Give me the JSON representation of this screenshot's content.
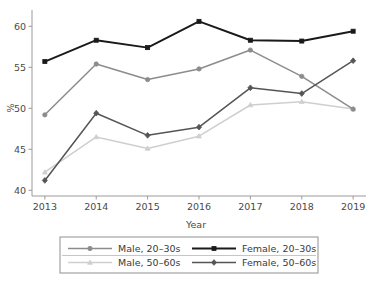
{
  "chart_data": {
    "type": "line",
    "title": "",
    "xlabel": "Year",
    "ylabel": "%",
    "categories": [
      "2013",
      "2014",
      "2015",
      "2016",
      "2017",
      "2018",
      "2019"
    ],
    "x": [
      2013,
      2014,
      2015,
      2016,
      2017,
      2018,
      2019
    ],
    "xlim": [
      2012.75,
      2019.25
    ],
    "ylim": [
      39.3,
      61.5
    ],
    "yticks": [
      40,
      45,
      50,
      55,
      60
    ],
    "ytick_labels": [
      "40",
      "45",
      "50",
      "55",
      "60"
    ],
    "xtick_labels": [
      "2013",
      "2014",
      "2015",
      "2016",
      "2017",
      "2018",
      "2019"
    ],
    "grid": false,
    "legend_position": "below-center",
    "series": [
      {
        "name": "Male, 20–30s",
        "marker": "circle",
        "color": "#8c8c8c",
        "values": [
          49.2,
          55.4,
          53.5,
          54.8,
          57.1,
          53.9,
          49.9
        ]
      },
      {
        "name": "Female, 20–30s",
        "marker": "square",
        "color": "#1a1a1a",
        "values": [
          55.7,
          58.3,
          57.4,
          60.6,
          58.3,
          58.2,
          59.4
        ]
      },
      {
        "name": "Male, 50–60s",
        "marker": "triangle",
        "color": "#cfcfcf",
        "values": [
          42.2,
          46.5,
          45.1,
          46.6,
          50.4,
          50.8,
          49.9
        ]
      },
      {
        "name": "Female, 50–60s",
        "marker": "diamond",
        "color": "#555555",
        "values": [
          41.2,
          49.4,
          46.7,
          47.7,
          52.5,
          51.8,
          55.8
        ]
      }
    ]
  },
  "axes": {
    "x_title": "Year",
    "y_title": "%",
    "x_ticks": [
      "2013",
      "2014",
      "2015",
      "2016",
      "2017",
      "2018",
      "2019"
    ],
    "y_ticks": [
      "60",
      "55",
      "50",
      "45",
      "40"
    ]
  },
  "legend": {
    "entries": [
      {
        "label": "Male, 20–30s",
        "marker": "circle",
        "color": "#8c8c8c"
      },
      {
        "label": "Female, 20–30s",
        "marker": "square",
        "color": "#1a1a1a"
      },
      {
        "label": "Male, 50–60s",
        "marker": "triangle",
        "color": "#cfcfcf"
      },
      {
        "label": "Female, 50–60s",
        "marker": "diamond",
        "color": "#555555"
      }
    ]
  },
  "colors": {
    "male_20_30": "#8c8c8c",
    "female_20_30": "#1a1a1a",
    "male_50_60": "#cfcfcf",
    "female_50_60": "#555555",
    "axis": "#9a9a9a",
    "text": "#3a3a3a",
    "background": "#ffffff"
  }
}
